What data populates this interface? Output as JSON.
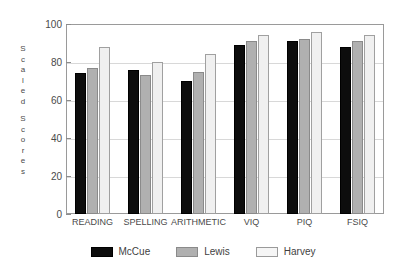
{
  "chart_data": {
    "type": "bar",
    "title": "",
    "subtitle": "",
    "xlabel": "",
    "ylabel": "Scaled Scores",
    "ylim": [
      0,
      100
    ],
    "yticks": [
      0,
      20,
      40,
      60,
      80,
      100
    ],
    "ytick_labels": [
      "0",
      "20",
      "40",
      "60",
      "80",
      "100"
    ],
    "grid": true,
    "legend_position": "bottom",
    "categories": [
      "READING",
      "SPELLING",
      "ARITHMETIC",
      "VIQ",
      "PIQ",
      "FSIQ"
    ],
    "series": [
      {
        "name": "McCue",
        "color": "#0d0d0d",
        "values": [
          74,
          76,
          70,
          89,
          91,
          88
        ]
      },
      {
        "name": "Lewis",
        "color": "#b0b0b0",
        "values": [
          77,
          73,
          75,
          91,
          92,
          91
        ]
      },
      {
        "name": "Harvey",
        "color": "#f0f0f0",
        "values": [
          88,
          80,
          84,
          94,
          96,
          94
        ]
      }
    ]
  },
  "axis": {
    "vertical_title_chars": [
      "S",
      "c",
      "a",
      "l",
      "e",
      "d",
      "",
      "S",
      "c",
      "o",
      "r",
      "e",
      "s"
    ]
  },
  "legend": {
    "items": [
      {
        "label": "McCue",
        "swatch": "legend-swatch-mccue"
      },
      {
        "label": "Lewis",
        "swatch": "legend-swatch-lewis"
      },
      {
        "label": "Harvey",
        "swatch": "legend-swatch-harvey"
      }
    ]
  },
  "colors": {
    "mccue": "#0d0d0d",
    "lewis": "#b0b0b0",
    "harvey": "#f0f0f0",
    "frame": "#9a9a9a",
    "grid": "#d8d8d8",
    "text": "#4a4a4a"
  }
}
